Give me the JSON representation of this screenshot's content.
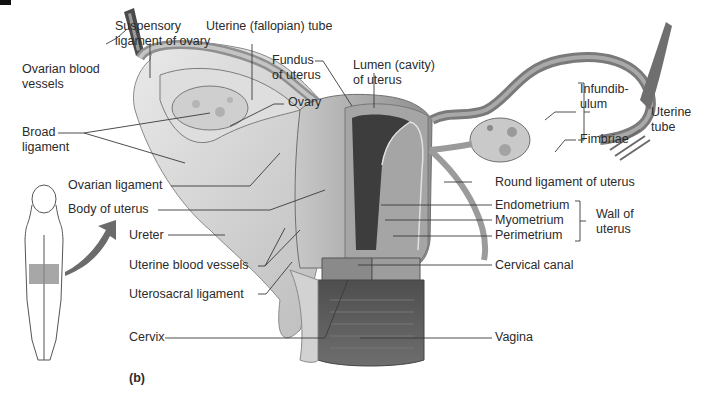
{
  "figure": {
    "panel_label": "(b)",
    "labels_left": {
      "suspensory_ligament": [
        "Suspensory",
        "ligament of ovary"
      ],
      "uterine_fallopian_tube": "Uterine (fallopian) tube",
      "ovarian_blood_vessels": [
        "Ovarian blood",
        "vessels"
      ],
      "broad_ligament": [
        "Broad",
        "ligament"
      ],
      "ovarian_ligament": "Ovarian ligament",
      "body_of_uterus": "Body of uterus",
      "ureter": "Ureter",
      "uterine_blood_vessels": "Uterine blood vessels",
      "uterosacral_ligament": "Uterosacral ligament",
      "cervix": "Cervix"
    },
    "labels_center": {
      "fundus": [
        "Fundus",
        "of uterus"
      ],
      "lumen": [
        "Lumen (cavity)",
        "of uterus"
      ],
      "ovary": "Ovary"
    },
    "labels_right": {
      "infundibulum": [
        "Infundib-",
        "ulum"
      ],
      "fimbriae": "Fimbriae",
      "uterine_tube_group": [
        "Uterine",
        "tube"
      ],
      "round_ligament": "Round ligament of uterus",
      "endometrium": "Endometrium",
      "myometrium": "Myometrium",
      "perimetrium": "Perimetrium",
      "wall_group": [
        "Wall of",
        "uterus"
      ],
      "cervical_canal": "Cervical canal",
      "vagina": "Vagina"
    },
    "colors": {
      "background": "#ffffff",
      "label_text": "#2b2b2b",
      "leader_line": "#3a3a3a",
      "tissue_light": "#d9d9d9",
      "tissue_mid": "#9a9a9a",
      "tissue_dark": "#555555",
      "orientation_arrow": "#6b6b6b"
    }
  }
}
